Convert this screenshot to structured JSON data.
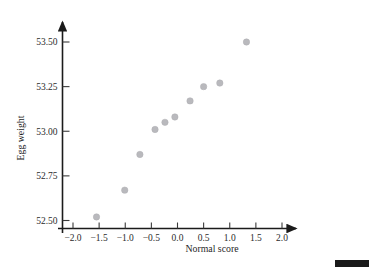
{
  "figure": {
    "background": "#ffffff",
    "point_color": "#b9b9bd",
    "axis_color": "#1b1b1b",
    "corner_bar_color": "#1a1a1a"
  },
  "chart_data": {
    "type": "scatter",
    "title": "",
    "xlabel": "Normal score",
    "ylabel": "Egg weight",
    "xlim": [
      -2.25,
      2.3
    ],
    "ylim": [
      52.42,
      53.6
    ],
    "grid": false,
    "legend": null,
    "xticks": [
      -2.0,
      -1.5,
      -1.0,
      -0.5,
      0.0,
      0.5,
      1.0,
      1.5,
      2.0
    ],
    "xtick_labels": [
      "−2.0",
      "−1.5",
      "−1.0",
      "−0.5",
      "0.0",
      "0.5",
      "1.0",
      "1.5",
      "2.0"
    ],
    "yticks": [
      52.5,
      52.75,
      53.0,
      53.25,
      53.5
    ],
    "ytick_labels": [
      "52.50",
      "52.75",
      "53.00",
      "53.25",
      "53.50"
    ],
    "x": [
      -1.55,
      -1.01,
      -0.72,
      -0.43,
      -0.24,
      -0.05,
      0.24,
      0.5,
      0.81,
      1.32
    ],
    "y": [
      52.52,
      52.67,
      52.87,
      53.01,
      53.05,
      53.08,
      53.17,
      53.25,
      53.27,
      53.5
    ],
    "points": [
      {
        "x": -1.55,
        "y": 52.52
      },
      {
        "x": -1.01,
        "y": 52.67
      },
      {
        "x": -0.72,
        "y": 52.87
      },
      {
        "x": -0.43,
        "y": 53.01
      },
      {
        "x": -0.24,
        "y": 53.05
      },
      {
        "x": -0.05,
        "y": 53.08
      },
      {
        "x": 0.24,
        "y": 53.17
      },
      {
        "x": 0.5,
        "y": 53.25
      },
      {
        "x": 0.81,
        "y": 53.27
      },
      {
        "x": 1.32,
        "y": 53.5
      }
    ],
    "marker_size": 3.2
  }
}
